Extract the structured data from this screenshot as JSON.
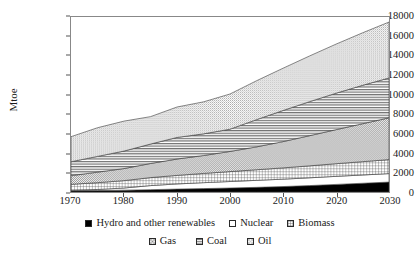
{
  "chart_data": {
    "type": "area",
    "stacked": true,
    "title": "",
    "subtitle": "",
    "xlabel": "",
    "ylabel": "Mtoe",
    "xlim": [
      1970,
      2030
    ],
    "ylim": [
      0,
      18000
    ],
    "grid": false,
    "legend_position": "bottom",
    "x": [
      1970,
      1975,
      1980,
      1985,
      1990,
      1995,
      2000,
      2005,
      2010,
      2015,
      2020,
      2025,
      2030
    ],
    "xticks": [
      "1970",
      "1980",
      "1990",
      "2000",
      "2010",
      "2020",
      "2030"
    ],
    "xtick_values": [
      1970,
      1980,
      1990,
      2000,
      2010,
      2020,
      2030
    ],
    "yticks": [
      "0",
      "2000",
      "4000",
      "6000",
      "8000",
      "10000",
      "12000",
      "14000",
      "16000",
      "18000"
    ],
    "ytick_values": [
      0,
      2000,
      4000,
      6000,
      8000,
      10000,
      12000,
      14000,
      16000,
      18000
    ],
    "stack_order_bottom_to_top": [
      "Hydro and other renewables",
      "Nuclear",
      "Biomass",
      "Gas",
      "Coal",
      "Oil"
    ],
    "series": [
      {
        "name": "Hydro and other renewables",
        "pattern": "solid-black",
        "color": "#000000",
        "values": [
          120,
          150,
          190,
          240,
          300,
          350,
          410,
          480,
          560,
          660,
          780,
          900,
          1020
        ]
      },
      {
        "name": "Nuclear",
        "pattern": "blank-white",
        "color": "#ffffff",
        "values": [
          30,
          110,
          220,
          420,
          530,
          610,
          670,
          720,
          760,
          800,
          830,
          850,
          870
        ]
      },
      {
        "name": "Biomass",
        "pattern": "grid",
        "color": "#bdbdbd",
        "values": [
          640,
          700,
          760,
          820,
          880,
          950,
          1020,
          1090,
          1160,
          1230,
          1300,
          1370,
          1440
        ]
      },
      {
        "name": "Gas",
        "pattern": "checker",
        "color": "#c8c8c8",
        "values": [
          890,
          1080,
          1240,
          1450,
          1680,
          1840,
          2070,
          2350,
          2700,
          3100,
          3500,
          3900,
          4300
        ]
      },
      {
        "name": "Coal",
        "pattern": "horizontal-lines",
        "color": "#9a9a9a",
        "values": [
          1430,
          1620,
          1800,
          2000,
          2220,
          2230,
          2290,
          2800,
          3200,
          3500,
          3750,
          3950,
          4100
        ]
      },
      {
        "name": "Oil",
        "pattern": "fine-dots",
        "color": "#d6d6d6",
        "values": [
          2580,
          2950,
          3080,
          2820,
          3130,
          3290,
          3620,
          4000,
          4350,
          4700,
          5050,
          5400,
          5750
        ]
      }
    ],
    "totals": [
      5690,
      6610,
      7290,
      7750,
      8740,
      9270,
      10080,
      11440,
      12730,
      13990,
      15210,
      16370,
      17480
    ]
  },
  "legend": {
    "rows": [
      [
        {
          "label": "Hydro and other renewables",
          "swatch": "solid-black"
        },
        {
          "label": "Nuclear",
          "swatch": "blank-white"
        },
        {
          "label": "Biomass",
          "swatch": "grid"
        }
      ],
      [
        {
          "label": "Gas",
          "swatch": "checker"
        },
        {
          "label": "Coal",
          "swatch": "horizontal-lines"
        },
        {
          "label": "Oil",
          "swatch": "fine-dots"
        }
      ]
    ]
  }
}
